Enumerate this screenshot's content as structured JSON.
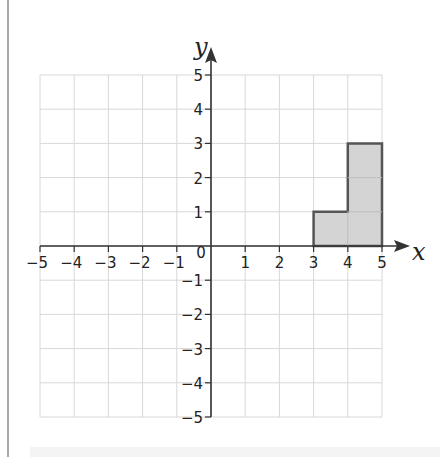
{
  "chart_data": {
    "type": "area",
    "title": "",
    "xlabel": "x",
    "ylabel": "y",
    "xlim": [
      -5,
      5
    ],
    "ylim": [
      -5,
      5
    ],
    "grid": true,
    "x_ticks": [
      "-5",
      "-4",
      "-3",
      "-2",
      "-1",
      "0",
      "1",
      "2",
      "3",
      "4",
      "5"
    ],
    "y_ticks": [
      "5",
      "4",
      "3",
      "2",
      "1",
      "-1",
      "-2",
      "-3",
      "-4",
      "-5"
    ],
    "origin_label": "0",
    "shapes": [
      {
        "name": "shaded-L-shape",
        "vertices": [
          [
            3,
            0
          ],
          [
            5,
            0
          ],
          [
            5,
            3
          ],
          [
            4,
            3
          ],
          [
            4,
            1
          ],
          [
            3,
            1
          ]
        ],
        "fill": "#d4d4d4",
        "stroke": "#555555"
      }
    ]
  },
  "colors": {
    "grid": "#d8d8d8",
    "axis": "#333333",
    "shape_fill": "#d4d4d4",
    "shape_stroke": "#555555"
  }
}
